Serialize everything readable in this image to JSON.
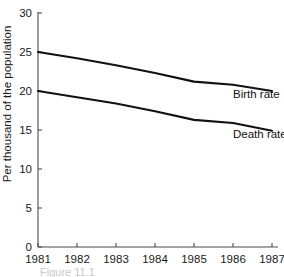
{
  "chart_data": {
    "type": "line",
    "title": "",
    "xlabel": "",
    "ylabel": "Per thousand of the population",
    "categories": [
      "1981",
      "1982",
      "1983",
      "1984",
      "1985",
      "1986",
      "1987"
    ],
    "x": [
      1981,
      1982,
      1983,
      1984,
      1985,
      1986,
      1987
    ],
    "xlim": [
      1981,
      1987
    ],
    "ylim": [
      0,
      30
    ],
    "yticks": [
      "0",
      "5",
      "10",
      "15",
      "20",
      "25",
      "30"
    ],
    "ytick_values": [
      0,
      5,
      10,
      15,
      20,
      25,
      30
    ],
    "grid": false,
    "legend_position": "inline-right",
    "series": [
      {
        "name": "Birth rate",
        "label": "Birth rate",
        "color": "#111111",
        "values": [
          25.0,
          24.2,
          23.3,
          22.3,
          21.2,
          20.8,
          20.0
        ]
      },
      {
        "name": "Death rate",
        "label": "Death rate",
        "color": "#111111",
        "values": [
          20.0,
          19.2,
          18.4,
          17.4,
          16.3,
          15.9,
          14.9
        ]
      }
    ],
    "annotations": [
      {
        "text": "Birth rate",
        "x": 1986.0,
        "y": 20.5
      },
      {
        "text": "Death rate",
        "x": 1986.0,
        "y": 15.4
      }
    ]
  },
  "caption": {
    "text": "Figure 11.1"
  },
  "axis_colors": {
    "axis": "#4d4d4d",
    "series": "#111111",
    "text": "#1a1a1a"
  }
}
